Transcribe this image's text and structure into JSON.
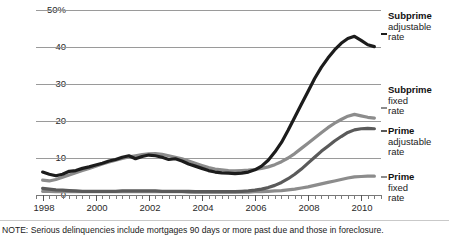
{
  "chart_data": {
    "type": "line",
    "title": "",
    "subtitle": "",
    "xlabel": "",
    "ylabel": "",
    "ylim": [
      0,
      50
    ],
    "xlim": [
      1997.75,
      2010.75
    ],
    "grid": true,
    "legend_position": "right",
    "y_ticks": [
      "50%",
      "40",
      "30",
      "20",
      "10",
      "0"
    ],
    "y_tick_values": [
      50,
      40,
      30,
      20,
      10,
      0
    ],
    "x_ticks": [
      "1998",
      "2000",
      "2002",
      "2004",
      "2006",
      "2008",
      "2010"
    ],
    "x_tick_values": [
      1998,
      2000,
      2002,
      2004,
      2006,
      2008,
      2010
    ],
    "x_minor_interval_years": 0.25,
    "series": [
      {
        "name": "Subprime adjustable rate",
        "color": "#1c1c1c",
        "x": [
          1998.0,
          1998.25,
          1998.5,
          1998.75,
          1999.0,
          1999.25,
          1999.5,
          1999.75,
          2000.0,
          2000.25,
          2000.5,
          2000.75,
          2001.0,
          2001.25,
          2001.5,
          2001.75,
          2002.0,
          2002.25,
          2002.5,
          2002.75,
          2003.0,
          2003.25,
          2003.5,
          2003.75,
          2004.0,
          2004.25,
          2004.5,
          2004.75,
          2005.0,
          2005.25,
          2005.5,
          2005.75,
          2006.0,
          2006.25,
          2006.5,
          2006.75,
          2007.0,
          2007.25,
          2007.5,
          2007.75,
          2008.0,
          2008.25,
          2008.5,
          2008.75,
          2009.0,
          2009.25,
          2009.5,
          2009.75,
          2010.0,
          2010.25,
          2010.5
        ],
        "values": [
          6.2,
          5.6,
          5.2,
          5.6,
          6.4,
          6.6,
          7.2,
          7.6,
          8.1,
          8.6,
          9.2,
          9.6,
          10.2,
          10.6,
          9.8,
          10.4,
          10.8,
          10.6,
          10.2,
          9.6,
          9.8,
          9.2,
          8.4,
          7.8,
          7.2,
          6.6,
          6.2,
          6.0,
          5.9,
          5.8,
          5.9,
          6.2,
          6.8,
          7.8,
          9.4,
          11.6,
          14.2,
          17.5,
          21.0,
          24.5,
          28.0,
          31.5,
          34.5,
          37.0,
          39.2,
          41.0,
          42.3,
          42.9,
          41.8,
          40.6,
          40.1
        ]
      },
      {
        "name": "Subprime fixed rate",
        "color": "#8c8c8c",
        "x": [
          1998.0,
          1998.25,
          1998.5,
          1998.75,
          1999.0,
          1999.25,
          1999.5,
          1999.75,
          2000.0,
          2000.25,
          2000.5,
          2000.75,
          2001.0,
          2001.25,
          2001.5,
          2001.75,
          2002.0,
          2002.25,
          2002.5,
          2002.75,
          2003.0,
          2003.25,
          2003.5,
          2003.75,
          2004.0,
          2004.25,
          2004.5,
          2004.75,
          2005.0,
          2005.25,
          2005.5,
          2005.75,
          2006.0,
          2006.25,
          2006.5,
          2006.75,
          2007.0,
          2007.25,
          2007.5,
          2007.75,
          2008.0,
          2008.25,
          2008.5,
          2008.75,
          2009.0,
          2009.25,
          2009.5,
          2009.75,
          2010.0,
          2010.25,
          2010.5
        ],
        "values": [
          4.0,
          3.8,
          4.2,
          4.8,
          5.4,
          6.0,
          6.6,
          7.2,
          7.8,
          8.4,
          8.9,
          9.4,
          9.9,
          10.3,
          10.6,
          10.9,
          11.1,
          11.2,
          11.0,
          10.6,
          10.2,
          9.8,
          9.2,
          8.6,
          8.0,
          7.4,
          7.0,
          6.8,
          6.6,
          6.5,
          6.6,
          6.7,
          6.9,
          7.2,
          7.6,
          8.2,
          9.0,
          10.0,
          11.2,
          12.6,
          14.0,
          15.4,
          16.8,
          18.2,
          19.4,
          20.4,
          21.3,
          21.8,
          21.4,
          21.0,
          20.8
        ]
      },
      {
        "name": "Prime adjustable rate",
        "color": "#5a5a5a",
        "x": [
          1998.0,
          1998.25,
          1998.5,
          1998.75,
          1999.0,
          1999.25,
          1999.5,
          1999.75,
          2000.0,
          2000.25,
          2000.5,
          2000.75,
          2001.0,
          2001.25,
          2001.5,
          2001.75,
          2002.0,
          2002.25,
          2002.5,
          2002.75,
          2003.0,
          2003.25,
          2003.5,
          2003.75,
          2004.0,
          2004.25,
          2004.5,
          2004.75,
          2005.0,
          2005.25,
          2005.5,
          2005.75,
          2006.0,
          2006.25,
          2006.5,
          2006.75,
          2007.0,
          2007.25,
          2007.5,
          2007.75,
          2008.0,
          2008.25,
          2008.5,
          2008.75,
          2009.0,
          2009.25,
          2009.5,
          2009.75,
          2010.0,
          2010.25,
          2010.5
        ],
        "values": [
          1.8,
          1.6,
          1.4,
          1.3,
          1.2,
          1.1,
          1.0,
          1.0,
          1.0,
          1.0,
          1.0,
          1.0,
          1.1,
          1.1,
          1.1,
          1.1,
          1.1,
          1.1,
          1.0,
          1.0,
          1.0,
          1.0,
          1.0,
          0.9,
          0.9,
          0.9,
          0.9,
          0.9,
          0.9,
          0.9,
          1.0,
          1.1,
          1.3,
          1.6,
          2.0,
          2.6,
          3.4,
          4.4,
          5.6,
          7.0,
          8.6,
          10.2,
          11.8,
          13.2,
          14.6,
          15.8,
          16.9,
          17.6,
          17.9,
          18.0,
          17.9
        ]
      },
      {
        "name": "Prime fixed rate",
        "color": "#8c8c8c",
        "x": [
          1998.0,
          1998.25,
          1998.5,
          1998.75,
          1999.0,
          1999.25,
          1999.5,
          1999.75,
          2000.0,
          2000.25,
          2000.5,
          2000.75,
          2001.0,
          2001.25,
          2001.5,
          2001.75,
          2002.0,
          2002.25,
          2002.5,
          2002.75,
          2003.0,
          2003.25,
          2003.5,
          2003.75,
          2004.0,
          2004.25,
          2004.5,
          2004.75,
          2005.0,
          2005.25,
          2005.5,
          2005.75,
          2006.0,
          2006.25,
          2006.5,
          2006.75,
          2007.0,
          2007.25,
          2007.5,
          2007.75,
          2008.0,
          2008.25,
          2008.5,
          2008.75,
          2009.0,
          2009.25,
          2009.5,
          2009.75,
          2010.0,
          2010.25,
          2010.5
        ],
        "values": [
          1.0,
          1.0,
          0.9,
          0.9,
          0.9,
          0.9,
          0.9,
          0.9,
          0.9,
          0.9,
          0.9,
          0.9,
          0.9,
          0.9,
          0.9,
          0.9,
          0.9,
          0.9,
          0.9,
          0.9,
          0.9,
          0.9,
          0.8,
          0.8,
          0.8,
          0.8,
          0.8,
          0.8,
          0.8,
          0.8,
          0.8,
          0.8,
          0.9,
          0.9,
          1.0,
          1.1,
          1.2,
          1.4,
          1.6,
          1.9,
          2.2,
          2.6,
          3.0,
          3.4,
          3.8,
          4.2,
          4.6,
          4.9,
          5.0,
          5.1,
          5.1
        ]
      }
    ]
  },
  "legend": {
    "entries": [
      {
        "title": "Subprime",
        "line2": "adjustable",
        "line3": "rate",
        "color": "#1c1c1c"
      },
      {
        "title": "Subprime",
        "line2": "fixed",
        "line3": "rate",
        "color": "#8c8c8c"
      },
      {
        "title": "Prime",
        "line2": "adjustable",
        "line3": "rate",
        "color": "#5a5a5a"
      },
      {
        "title": "Prime",
        "line2": "fixed",
        "line3": "rate",
        "color": "#8c8c8c"
      }
    ]
  },
  "note": {
    "text": "NOTE: Serious delinquencies include mortgages 90 days or more past due and those in foreclosure."
  }
}
